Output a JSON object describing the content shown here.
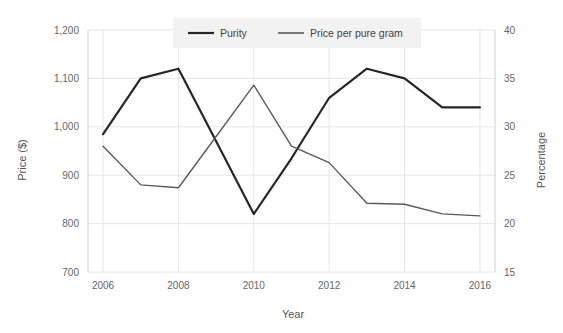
{
  "chart_data": {
    "type": "line",
    "title": "",
    "xlabel": "Year",
    "ylabel": "Price ($)",
    "y2label": "Percentage",
    "x": [
      2006,
      2007,
      2008,
      2009,
      2010,
      2011,
      2012,
      2013,
      2014,
      2015,
      2016
    ],
    "xticks": [
      "2006",
      "2008",
      "2010",
      "2012",
      "2014",
      "2016"
    ],
    "xtick_values": [
      2006,
      2008,
      2010,
      2012,
      2014,
      2016
    ],
    "xlim": [
      2005.6,
      2016.4
    ],
    "yticks": [
      "700",
      "800",
      "900",
      "1,000",
      "1,100",
      "1,200"
    ],
    "ytick_values": [
      700,
      800,
      900,
      1000,
      1100,
      1200
    ],
    "ylim": [
      700,
      1200
    ],
    "y2ticks": [
      "15",
      "20",
      "25",
      "30",
      "35",
      "40"
    ],
    "y2tick_values": [
      15,
      20,
      25,
      30,
      35,
      40
    ],
    "y2lim": [
      15,
      40
    ],
    "grid": true,
    "legend_position": "top-center",
    "series": [
      {
        "name": "Price per pure gram",
        "axis": "left",
        "color": "#262626",
        "values": [
          985,
          1100,
          1120,
          970,
          820,
          935,
          1060,
          1120,
          1100,
          1040,
          1040
        ]
      },
      {
        "name": "Purity",
        "axis": "right",
        "color": "#5a5a5a",
        "values": [
          28.0,
          24.0,
          23.7,
          29.0,
          34.3,
          28.0,
          26.3,
          22.1,
          22.0,
          21.0,
          20.8
        ]
      }
    ],
    "legend": [
      {
        "label": "Purity",
        "color": "#262626"
      },
      {
        "label": "Price per pure gram",
        "color": "#5a5a5a"
      }
    ]
  }
}
